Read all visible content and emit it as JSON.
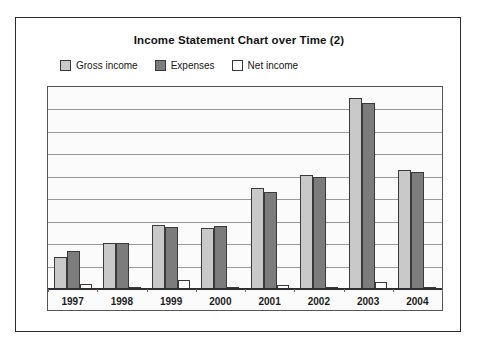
{
  "title": "Income Statement Chart over Time (2)",
  "legend": {
    "position": "top-left",
    "items": [
      {
        "label": "Gross income",
        "color": "#c9c9c9",
        "icon": "legend-swatch-icon"
      },
      {
        "label": "Expenses",
        "color": "#7c7c7c",
        "icon": "legend-swatch-icon"
      },
      {
        "label": "Net income",
        "color": "#ffffff",
        "icon": "legend-swatch-icon"
      }
    ]
  },
  "chart_data": {
    "type": "bar",
    "title": "Income Statement Chart over Time (2)",
    "xlabel": "",
    "ylabel": "",
    "grid": true,
    "legend_position": "top-left",
    "ylim": [
      0,
      9
    ],
    "gridline_count": 9,
    "categories": [
      "1997",
      "1998",
      "1999",
      "2000",
      "2001",
      "2002",
      "2003",
      "2004"
    ],
    "series": [
      {
        "name": "Gross income",
        "color": "#c9c9c9",
        "values": [
          1.43,
          2.05,
          2.85,
          2.72,
          4.5,
          5.08,
          8.51,
          5.3
        ]
      },
      {
        "name": "Expenses",
        "color": "#7c7c7c",
        "values": [
          1.69,
          2.05,
          2.76,
          2.81,
          4.32,
          4.99,
          8.29,
          5.21
        ]
      },
      {
        "name": "Net income",
        "color": "#ffffff",
        "values": [
          0.22,
          0.09,
          0.4,
          0.09,
          0.18,
          0.09,
          0.31,
          0.04
        ]
      }
    ]
  },
  "axis": {
    "x_tick_labels": [
      "1997",
      "1998",
      "1999",
      "2000",
      "2001",
      "2002",
      "2003",
      "2004"
    ]
  },
  "colors": {
    "gross_income": "#c9c9c9",
    "expenses": "#7c7c7c",
    "net_income": "#ffffff",
    "plot_background": "#fbfbfb",
    "gridline": "#9a9a9a",
    "axis_line": "#2f2f2f",
    "frame": "#2b2b2b",
    "text": "#141414"
  }
}
